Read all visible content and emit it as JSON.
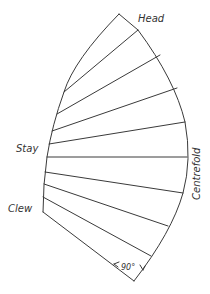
{
  "diagram": {
    "labels": {
      "head": "Head",
      "stay": "Stay",
      "clew": "Clew",
      "centrefold": "Centrefold",
      "angle": "90°"
    },
    "outline": {
      "head_point": [
        119,
        14
      ],
      "clew_point": [
        43,
        212
      ],
      "tack_point": [
        134,
        281
      ]
    },
    "seams": [
      {
        "from": [
          64,
          92
        ],
        "to": [
          138,
          30
        ]
      },
      {
        "from": [
          57,
          114
        ],
        "to": [
          160,
          55
        ]
      },
      {
        "from": [
          52,
          131
        ],
        "to": [
          177,
          88
        ]
      },
      {
        "from": [
          49,
          144
        ],
        "to": [
          185,
          122
        ]
      },
      {
        "from": [
          47,
          157
        ],
        "to": [
          187,
          157
        ]
      },
      {
        "from": [
          45,
          172
        ],
        "to": [
          183,
          193
        ]
      },
      {
        "from": [
          44,
          184
        ],
        "to": [
          168,
          226
        ]
      },
      {
        "from": [
          43,
          197
        ],
        "to": [
          151,
          256
        ]
      }
    ],
    "colors": {
      "line": "#3a3a3a",
      "text": "#333333",
      "background": "#ffffff"
    }
  }
}
